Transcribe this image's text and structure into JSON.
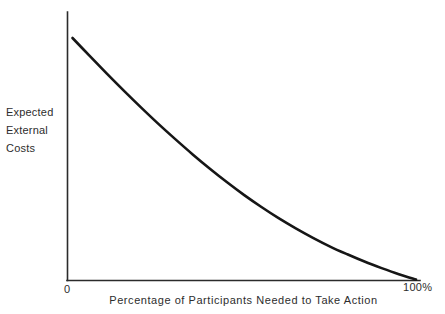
{
  "chart_data": {
    "type": "line",
    "title": "",
    "subtitle": "",
    "xlabel": "Percentage of Participants Needed to Take Action",
    "ylabel": "Expected\nExternal\nCosts",
    "ylabel_lines": [
      "Expected",
      "External",
      "Costs"
    ],
    "x_tick_labels": [
      "0",
      "100%"
    ],
    "y_tick_labels": [],
    "xlim": [
      0,
      100
    ],
    "ylim": [
      0,
      100
    ],
    "grid": false,
    "legend": null,
    "annotations": [],
    "series": [
      {
        "name": "Expected External Costs",
        "color": "#161616",
        "x": [
          0,
          5,
          10,
          15,
          20,
          25,
          30,
          35,
          40,
          45,
          50,
          55,
          60,
          65,
          70,
          75,
          80,
          85,
          90,
          95,
          100
        ],
        "y": [
          100,
          92.6,
          85.3,
          78.2,
          71.3,
          64.6,
          58.2,
          52.0,
          46.1,
          40.5,
          35.2,
          30.3,
          25.7,
          21.5,
          17.6,
          14.0,
          10.8,
          7.8,
          5.1,
          2.6,
          0.4
        ]
      }
    ]
  },
  "axes": {
    "y_axis_name": "expected-external-costs-axis",
    "x_axis_name": "percentage-participants-axis",
    "line_color": "#2b2b2b"
  }
}
